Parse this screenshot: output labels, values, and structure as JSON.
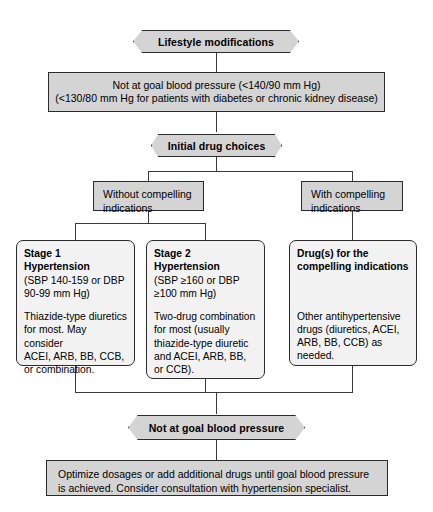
{
  "diagram": {
    "colors": {
      "node_fill_grey": "#d4d4d4",
      "node_fill_light": "#f2f2f2",
      "border": "#2b2b2b",
      "connector": "#3a3a3a",
      "text": "#000000"
    },
    "nodes": {
      "lifestyle": {
        "shape": "hexagon",
        "label": "Lifestyle modifications"
      },
      "not_at_goal_1": {
        "shape": "rectangle",
        "line1": "Not at goal blood pressure (<140/90 mm Hg)",
        "line2": "(<130/80 mm Hg for patients with diabetes or chronic kidney disease)"
      },
      "initial_drug_choices": {
        "shape": "hexagon",
        "label": "Initial drug choices"
      },
      "without_compelling": {
        "shape": "rectangle",
        "line1": "Without compelling",
        "line2": "indications"
      },
      "with_compelling": {
        "shape": "rectangle",
        "line1": "With compelling",
        "line2": "indications"
      },
      "stage1": {
        "shape": "rounded-rectangle",
        "heading_line1": "Stage 1",
        "heading_line2": "Hypertension",
        "detail_line1": "(SBP 140-159 or DBP",
        "detail_line2": "90-99 mm Hg)",
        "body_line1": "Thiazide-type diuretics",
        "body_line2": "for most. May consider",
        "body_line3": "ACEI, ARB, BB, CCB,",
        "body_line4": "or combination."
      },
      "stage2": {
        "shape": "rounded-rectangle",
        "heading_line1": "Stage 2",
        "heading_line2": "Hypertension",
        "detail_line1": "(SBP ≥160 or DBP",
        "detail_line2": "≥100 mm Hg)",
        "body_line1": "Two-drug combination",
        "body_line2": "for most (usually",
        "body_line3": "thiazide-type diuretic",
        "body_line4": "and ACEI, ARB, BB,",
        "body_line5": "or CCB)."
      },
      "compelling_drugs": {
        "shape": "rounded-rectangle",
        "heading_line1": "Drug(s) for the",
        "heading_line2": "compelling indications",
        "body_line1": "Other antihypertensive",
        "body_line2": "drugs (diuretics, ACEI,",
        "body_line3": "ARB, BB, CCB) as",
        "body_line4": "needed."
      },
      "not_at_goal_2": {
        "shape": "hexagon",
        "label": "Not at goal blood pressure"
      },
      "optimize": {
        "shape": "rectangle",
        "line1": "Optimize dosages or add additional drugs until goal blood pressure",
        "line2": "is achieved. Consider consultation with hypertension specialist."
      }
    }
  }
}
